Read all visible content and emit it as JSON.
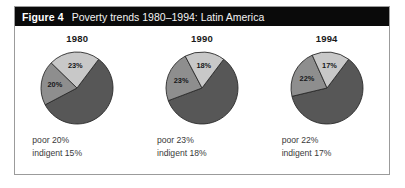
{
  "figure": {
    "label": "Figure 4",
    "title": "Poverty trends 1980–1994: Latin America"
  },
  "colors": {
    "title_bar_bg": "#0a0a0a",
    "title_text": "#ffffff",
    "box_border": "#9b9b9b",
    "page_bg": "#ffffff",
    "slice_nonpoor": "#575757",
    "slice_poor": "#8e8e8e",
    "slice_indigent": "#c8c8c8",
    "slice_outline": "#2b2b2b",
    "caption_text": "#3a3a3a"
  },
  "panels": [
    {
      "year": "1980",
      "poor_label": "20%",
      "indigent_label": "23%",
      "caption_poor": "poor 20%",
      "caption_indigent": "indigent 15%"
    },
    {
      "year": "1990",
      "poor_label": "23%",
      "indigent_label": "18%",
      "caption_poor": "poor 23%",
      "caption_indigent": "indigent 18%"
    },
    {
      "year": "1994",
      "poor_label": "22%",
      "indigent_label": "17%",
      "caption_poor": "poor 22%",
      "caption_indigent": "indigent 17%"
    }
  ],
  "chart_data": {
    "type": "pie",
    "title": "Poverty trends 1980–1994: Latin America",
    "subtitle": "",
    "xlabel": "",
    "ylabel": "",
    "grid": false,
    "legend_position": "none",
    "note": "Three pie charts, one per year. Each pie has three slices: non-poor (dark gray, unlabeled remainder), poor (mid gray, labeled on slice), indigent (light gray, labeled on slice). Captions beneath restate poor and indigent shares.",
    "series": [
      {
        "name": "poor",
        "color": "#8e8e8e",
        "categories": [
          "1980",
          "1990",
          "1994"
        ],
        "values": [
          20,
          23,
          22
        ]
      },
      {
        "name": "indigent",
        "color": "#c8c8c8",
        "categories": [
          "1980",
          "1990",
          "1994"
        ],
        "values": [
          23,
          18,
          17
        ]
      },
      {
        "name": "non-poor",
        "color": "#575757",
        "categories": [
          "1980",
          "1990",
          "1994"
        ],
        "values": [
          57,
          59,
          61
        ]
      }
    ],
    "pies": [
      {
        "year": "1980",
        "slices": [
          {
            "label": "non-poor",
            "value": 57,
            "display": "",
            "color": "#575757"
          },
          {
            "label": "poor",
            "value": 20,
            "display": "20%",
            "color": "#8e8e8e"
          },
          {
            "label": "indigent",
            "value": 23,
            "display": "23%",
            "color": "#c8c8c8"
          }
        ]
      },
      {
        "year": "1990",
        "slices": [
          {
            "label": "non-poor",
            "value": 59,
            "display": "",
            "color": "#575757"
          },
          {
            "label": "poor",
            "value": 23,
            "display": "23%",
            "color": "#8e8e8e"
          },
          {
            "label": "indigent",
            "value": 18,
            "display": "18%",
            "color": "#c8c8c8"
          }
        ]
      },
      {
        "year": "1994",
        "slices": [
          {
            "label": "non-poor",
            "value": 61,
            "display": "",
            "color": "#575757"
          },
          {
            "label": "poor",
            "value": 22,
            "display": "22%",
            "color": "#8e8e8e"
          },
          {
            "label": "indigent",
            "value": 17,
            "display": "17%",
            "color": "#c8c8c8"
          }
        ]
      }
    ]
  }
}
